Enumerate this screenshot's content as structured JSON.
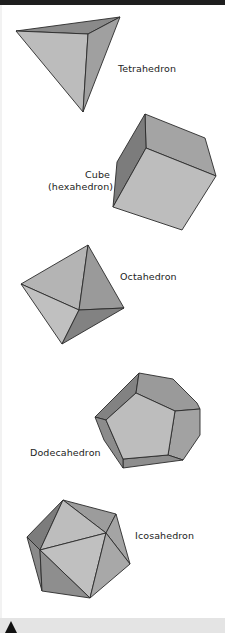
{
  "colors": {
    "top_bar": "#1e1e1e",
    "footer_bar": "#e4e4e4",
    "footer_marker": "#111111",
    "face_light": "#bdbdbd",
    "face_mid": "#a2a2a2",
    "face_dark": "#7e7e7e",
    "edge": "#2a2a2a"
  },
  "solids": [
    {
      "id": "tetrahedron",
      "label": "Tetrahedron"
    },
    {
      "id": "cube",
      "label_line1": "Cube",
      "label_line2": "(hexahedron)"
    },
    {
      "id": "octahedron",
      "label": "Octahedron"
    },
    {
      "id": "dodecahedron",
      "label": "Dodecahedron"
    },
    {
      "id": "icosahedron",
      "label": "Icosahedron"
    }
  ],
  "footer": {
    "marker_icon": "triangle-up-icon"
  }
}
